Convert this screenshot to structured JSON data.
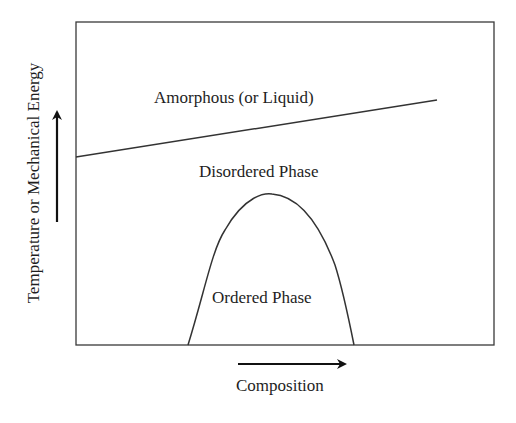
{
  "diagram": {
    "type": "phase-diagram",
    "x_axis_label": "Composition",
    "y_axis_label": "Temperature or Mechanical Energy",
    "regions": {
      "amorphous": "Amorphous (or Liquid)",
      "disordered": "Disordered Phase",
      "ordered": "Ordered Phase"
    },
    "colors": {
      "line": "#333333",
      "background": "#ffffff",
      "text": "#1e1e1e"
    }
  }
}
